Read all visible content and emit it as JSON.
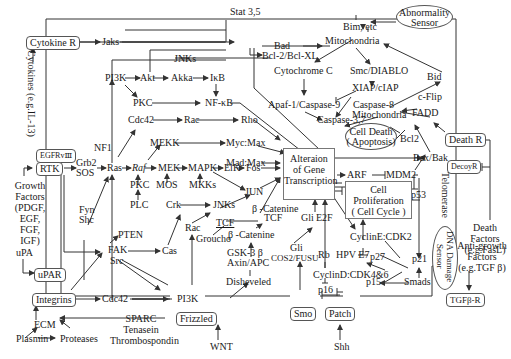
{
  "receptors": {
    "cytokine_r": "Cytokine R",
    "egfr": "EGFRvⅢ",
    "rtk": "RTK",
    "upar": "uPAR",
    "integrins": "Integrins",
    "frizzled": "Frizzled",
    "smo": "Smo",
    "patch": "Patch",
    "death_r": "Death R",
    "decoy_r": "DecoyR",
    "tgfb_r": "TGFβ-R"
  },
  "ligands": {
    "cytokines": "Cytokines (e.g.IL-13)",
    "growth_factors": [
      "Growth",
      "Factors",
      "(PDGF,",
      "EGF,",
      "FGF,",
      "IGF)"
    ],
    "upa": "uPA",
    "ecm": "ECM",
    "plasmin": "Plasmin",
    "proteases": "Proteases",
    "sparc": [
      "SPARC",
      "Tenasein",
      "Thrombospondin"
    ],
    "wnt": "WNT",
    "shh": "Shh",
    "death_factors": [
      "Death",
      "Factors",
      "(e.g.FasL)"
    ],
    "anti_growth": [
      "Anti-growth",
      "Factors",
      "(e.g.TGF β)"
    ]
  },
  "nodes": {
    "jaks": "Jaks",
    "stat": "Stat 3,5",
    "bad": "Bad",
    "bcl2_bclxl": "Bcl-2/Bcl-XL",
    "jnks_top": "JNKs",
    "pi3k_top": "PI3K",
    "akt": "Akt",
    "akka": "Akka",
    "ikb": "IκB",
    "pkc_top": "PKC",
    "nfkb": "NF-κB",
    "cdc42_top": "Cdc42",
    "rac_top": "Rac",
    "rho": "Rho",
    "mekk": "MEKK",
    "mycmax": "Myc:Max",
    "madmax": "Mad:Max",
    "nf1": "NF1",
    "grb2": "Grb2",
    "sos": "SOS",
    "ras": "Ras",
    "raf": "Raf",
    "mek": "MEK",
    "mapk": "MAPK",
    "elk": "ElK",
    "fos": "Fos",
    "pkc_mid": "PKC",
    "plc": "PLC",
    "mos": "MOS",
    "mkks": "MKKs",
    "jun": "JUN",
    "fyn": "Fyn",
    "shc": "Shc",
    "crk": "Crk",
    "jnks_mid": "JNKs",
    "rac_mid": "Rac",
    "pten": "PTEN",
    "fak": "FAK",
    "src": "Src",
    "cas": "Cas",
    "b_catenine_1": "β -Catenine",
    "tcf_1": "TCF",
    "tcf_2": "TCF",
    "groucho": "Groucho",
    "b_catenine_2": "β -Catenine",
    "gsk3b": "GSK-3 β",
    "axin_apc": "Axin/APC",
    "disheveled": "Disheveled",
    "cdc42_bot": "Cdc42",
    "pi3k_bot": "PI3K",
    "gli_1": "Gli",
    "e2f": "E2F",
    "gli_2": "Gli",
    "cos2_fusu": "COS2/FUSU",
    "rb": "Rb",
    "hpv_e7": "HPV E7",
    "cyclind_cdk46": "CyclinD:CDK4&6",
    "p16": "p16",
    "cycline_cdk2": "CyclinE:CDK2",
    "p27": "p27",
    "p15": "p15",
    "p21": "p21",
    "smads": "Smads",
    "p53": "p53",
    "arf": "ARF",
    "mdm2": "MDM2",
    "bax_bak": "Bax/Bak",
    "bcl2": "Bcl2",
    "mitochondria_top": "Mitochondria",
    "mitochondria_mid": "Mitochondria",
    "bim": "Bim, etc",
    "cytochrome_c": "Cytochrome C",
    "smac": "Smc/DIABLO",
    "xiap": "XIAP/cIAP",
    "apaf": "Apaf-1/Caspase-9",
    "caspase37": "Caspase-3,7",
    "caspase8": "Caspase-8",
    "bid": "Bid",
    "cflip": "c-Flip",
    "fadd": "FADD",
    "telomerase": "Telomerase"
  },
  "central": {
    "gene_transcription": [
      "Alteraion",
      "of Gene",
      "Transcription"
    ],
    "cell_proliferation": [
      "Cell",
      "Proliferation",
      "( Cell Cycle )"
    ],
    "cell_death": [
      "Cell Death",
      "( Apoptosis)"
    ],
    "abnormality_sensor": [
      "Abnormality",
      "Sensor"
    ],
    "dna_damage_sensor": [
      "DNA Damage",
      "Sensor"
    ]
  },
  "colors": {
    "line": "#333333",
    "box_border": "#555555",
    "background": "#ffffff"
  }
}
